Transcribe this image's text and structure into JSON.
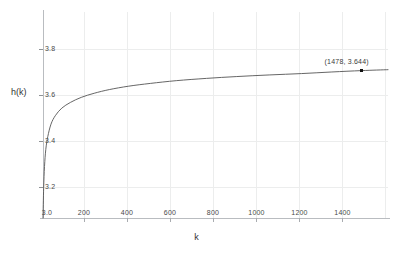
{
  "chart_data": {
    "type": "line",
    "title": "",
    "xlabel": "k",
    "ylabel": "h(k)",
    "xlim": [
      3,
      1600
    ],
    "ylim": [
      3.0,
      3.9
    ],
    "grid": true,
    "legend": null,
    "xticks": [
      {
        "value": 3,
        "label": "3.0"
      },
      {
        "value": 200,
        "label": "200"
      },
      {
        "value": 400,
        "label": "400"
      },
      {
        "value": 600,
        "label": "600"
      },
      {
        "value": 800,
        "label": "800"
      },
      {
        "value": 1000,
        "label": "1000"
      },
      {
        "value": 1200,
        "label": "1200"
      },
      {
        "value": 1400,
        "label": "1400"
      }
    ],
    "yticks": [
      {
        "value": 3.2,
        "label": "3.2"
      },
      {
        "value": 3.4,
        "label": "3.4"
      },
      {
        "value": 3.6,
        "label": "3.6"
      },
      {
        "value": 3.8,
        "label": "3.8"
      }
    ],
    "series": [
      {
        "name": "h(k)",
        "color": "#555555",
        "x": [
          3,
          6,
          10,
          16,
          25,
          40,
          60,
          90,
          130,
          180,
          240,
          310,
          400,
          500,
          620,
          760,
          900,
          1050,
          1200,
          1340,
          1478,
          1600
        ],
        "y": [
          3.0,
          3.13,
          3.225,
          3.3,
          3.355,
          3.41,
          3.447,
          3.48,
          3.505,
          3.527,
          3.545,
          3.561,
          3.576,
          3.588,
          3.6,
          3.61,
          3.618,
          3.625,
          3.631,
          3.638,
          3.644,
          3.648
        ]
      }
    ],
    "annotations": [
      {
        "label": "(1478,  3.644)",
        "x": 1478,
        "y": 3.644,
        "marker": "square",
        "marker_color": "#111111"
      }
    ]
  }
}
